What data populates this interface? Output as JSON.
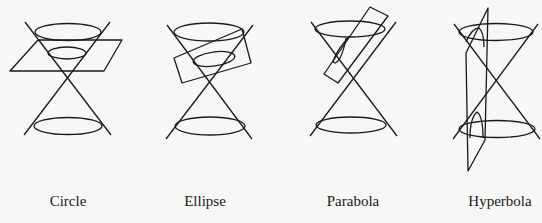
{
  "figures": [
    {
      "id": "circle",
      "label": "Circle",
      "label_x": 68
    },
    {
      "id": "ellipse",
      "label": "Ellipse",
      "label_x": 205
    },
    {
      "id": "parabola",
      "label": "Parabola",
      "label_x": 353
    },
    {
      "id": "hyperbola",
      "label": "Hyperbola",
      "label_x": 500
    }
  ],
  "colors": {
    "background": "#f7f7f5",
    "stroke": "#1a1a1a"
  }
}
